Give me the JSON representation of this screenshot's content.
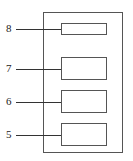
{
  "diagram": {
    "components": [
      {
        "label": "8",
        "top": 23,
        "height": 12
      },
      {
        "label": "7",
        "top": 57,
        "height": 23
      },
      {
        "label": "6",
        "top": 90,
        "height": 23
      },
      {
        "label": "5",
        "top": 123,
        "height": 23
      }
    ]
  }
}
